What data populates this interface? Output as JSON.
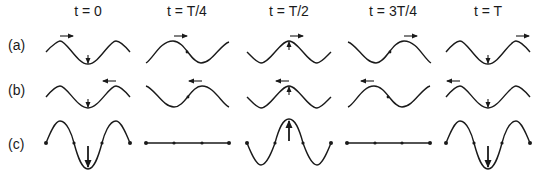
{
  "figure": {
    "columns": [
      {
        "label": "t = 0",
        "cx": 88
      },
      {
        "label": "t = T/4",
        "cx": 187
      },
      {
        "label": "t = T/2",
        "cx": 289
      },
      {
        "label": "t = 3T/4",
        "cx": 393
      },
      {
        "label": "t = T",
        "cx": 488
      }
    ],
    "rows": [
      {
        "label": "(a)",
        "y": 37,
        "description": "wave traveling right"
      },
      {
        "label": "(b)",
        "y": 82,
        "description": "wave traveling left"
      },
      {
        "label": "(c)",
        "y": 136,
        "description": "standing wave (superposition)"
      }
    ],
    "colors": {
      "stroke": "#1a1a1a",
      "background": "#ffffff"
    }
  }
}
